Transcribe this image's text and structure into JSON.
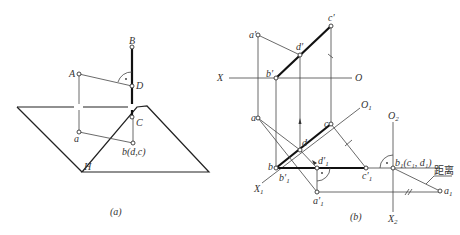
{
  "figure_a": {
    "caption": "(a)",
    "plane_label": "H",
    "points": {
      "A": "A",
      "B": "B",
      "C": "C",
      "D": "D",
      "a": "a",
      "bdc": "b(d,c)"
    }
  },
  "figure_b": {
    "caption": "(b)",
    "axes": {
      "X": "X",
      "O": "O",
      "X1": "X",
      "X1_sub": "1",
      "O1": "O",
      "O1_sub": "1",
      "O2": "O",
      "O2_sub": "2",
      "X2": "X",
      "X2_sub": "2"
    },
    "points": {
      "a_prime": "a′",
      "b_prime": "b′",
      "c_prime": "c′",
      "d_prime": "d′",
      "a": "a",
      "b": "b",
      "c": "c",
      "d": "d",
      "b1_prime": "b′",
      "b1_prime_sub": "1",
      "d1_prime": "d′",
      "d1_prime_sub": "1",
      "a1_prime": "a′",
      "a1_prime_sub": "1",
      "c1_prime": "c′",
      "c1_prime_sub": "1",
      "b1": "b",
      "b1_sub": "1",
      "b1_paren": "(c₁, d₁)",
      "a1": "a",
      "a1_sub": "1"
    },
    "annotation": "距离"
  }
}
